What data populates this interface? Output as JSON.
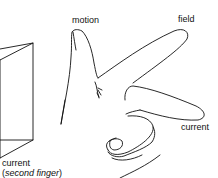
{
  "diagram": {
    "labels": {
      "motion": "motion",
      "field": "field",
      "current_right": "current",
      "current_left": "current",
      "current_left_note_open": "(",
      "current_left_note": "second finger",
      "current_left_note_close": ")"
    },
    "colors": {
      "ink": "#111111",
      "background": "#ffffff"
    }
  }
}
